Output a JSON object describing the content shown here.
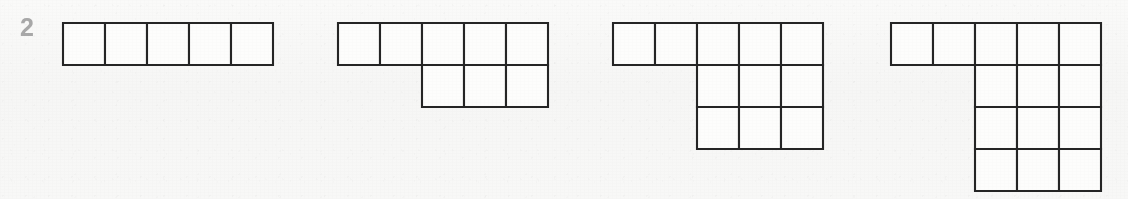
{
  "page": {
    "index_label": "2",
    "background_color": "#f7f7f6",
    "label_color": "#a8a8a8",
    "stroke_color": "#252525",
    "cell_fill_color": "#fdfdfc",
    "width": 1128,
    "height": 199
  },
  "chart_data": {
    "type": "diagram",
    "subtype": "young-diagram-sequence",
    "title": "",
    "xlabel": "",
    "ylabel": "",
    "cell_size": 42,
    "diagrams": [
      {
        "name": "diagram-1",
        "index": 1,
        "origin": {
          "x": 61,
          "y": 21
        },
        "cell_size": 42,
        "row_lengths": [
          5
        ],
        "row_offsets": [
          0
        ],
        "total_cells": 5,
        "rows": 1,
        "columns": 5
      },
      {
        "name": "diagram-2",
        "index": 2,
        "origin": {
          "x": 336,
          "y": 21
        },
        "cell_size": 42,
        "row_lengths": [
          5,
          3
        ],
        "row_offsets": [
          0,
          2
        ],
        "total_cells": 8,
        "rows": 2,
        "columns": 5
      },
      {
        "name": "diagram-3",
        "index": 3,
        "origin": {
          "x": 611,
          "y": 21
        },
        "cell_size": 42,
        "row_lengths": [
          5,
          3,
          3
        ],
        "row_offsets": [
          0,
          2,
          2
        ],
        "total_cells": 11,
        "rows": 3,
        "columns": 5
      },
      {
        "name": "diagram-4",
        "index": 4,
        "origin": {
          "x": 889,
          "y": 21
        },
        "cell_size": 42,
        "row_lengths": [
          5,
          3,
          3,
          3
        ],
        "row_offsets": [
          0,
          2,
          2,
          2
        ],
        "total_cells": 14,
        "rows": 4,
        "columns": 5
      }
    ]
  }
}
